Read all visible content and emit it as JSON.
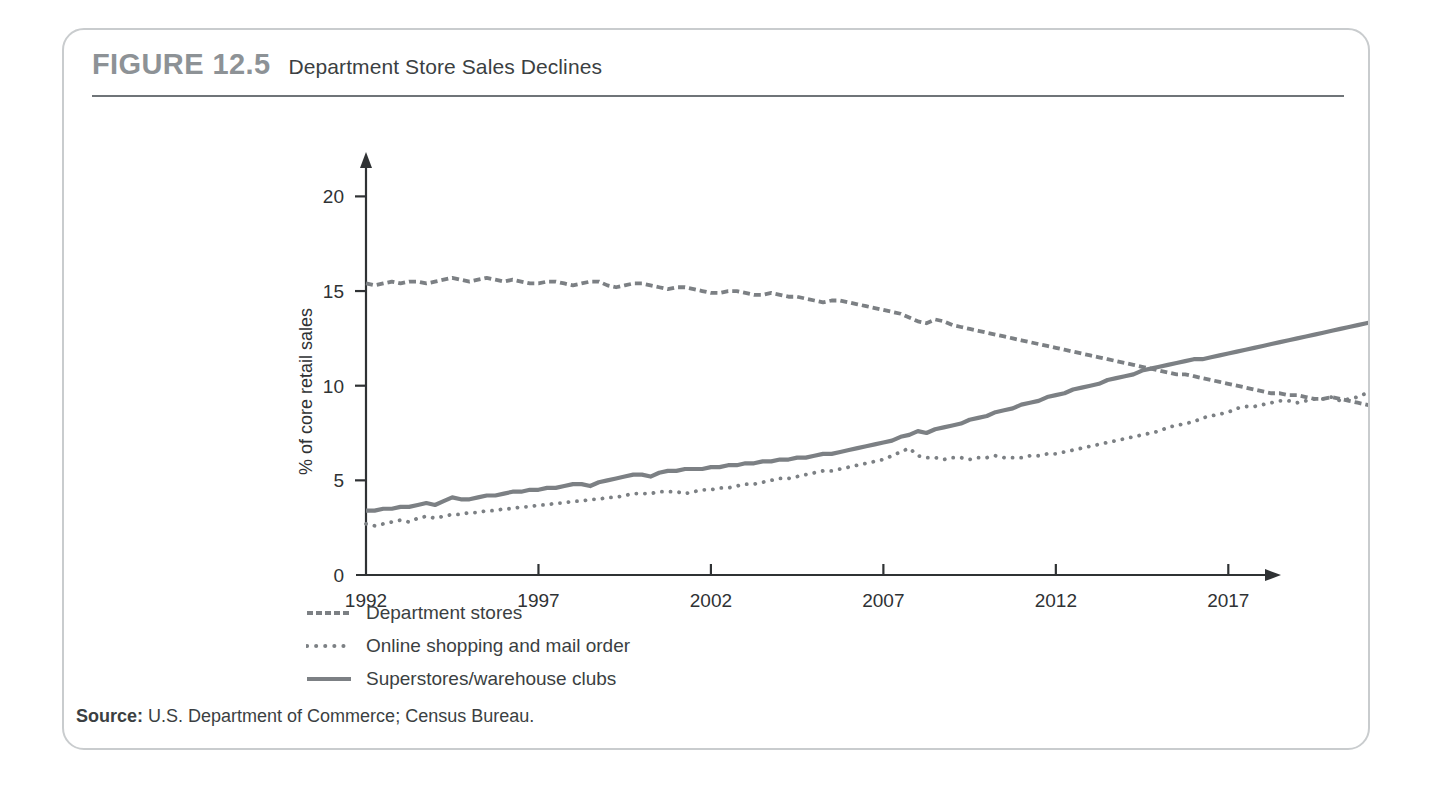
{
  "figure": {
    "number": "FIGURE 12.5",
    "title": "Department Store Sales Declines",
    "source_prefix": "Source:",
    "source_text": "U.S. Department of Commerce; Census Bureau."
  },
  "colors": {
    "line": "#7c8084",
    "frame": "#c9ccce",
    "rule": "#6f7478",
    "figure_number": "#8d9296",
    "text": "#3b3f42",
    "axis": "#2f3234"
  },
  "legend": {
    "position": "below-plot",
    "items": [
      {
        "label": "Department stores",
        "style": "dashed",
        "icon": "dashed-line-icon"
      },
      {
        "label": "Online shopping and mail order",
        "style": "dotted",
        "icon": "dotted-line-icon"
      },
      {
        "label": "Superstores/warehouse clubs",
        "style": "solid",
        "icon": "solid-line-icon"
      }
    ]
  },
  "chart_data": {
    "type": "line",
    "title": "Department Store Sales Declines",
    "xlabel": "",
    "ylabel": "% of core retail sales",
    "xlim": [
      1992,
      2017.6
    ],
    "ylim": [
      0,
      21.5
    ],
    "xticks": [
      1992,
      1997,
      2002,
      2007,
      2012,
      2017
    ],
    "xtick_labels": [
      "1992",
      "1997",
      "2002",
      "2007",
      "2012",
      "2017"
    ],
    "yticks": [
      0,
      5,
      10,
      15,
      20
    ],
    "ytick_labels": [
      "0",
      "5",
      "10",
      "15",
      "20"
    ],
    "grid": false,
    "axis_arrows": true,
    "x_start": 1992,
    "x_step": 0.25,
    "series": [
      {
        "name": "Department stores",
        "style": "dashed",
        "values": [
          15.4,
          15.3,
          15.4,
          15.5,
          15.4,
          15.5,
          15.5,
          15.4,
          15.5,
          15.6,
          15.7,
          15.6,
          15.5,
          15.6,
          15.7,
          15.6,
          15.5,
          15.6,
          15.5,
          15.4,
          15.4,
          15.5,
          15.5,
          15.4,
          15.3,
          15.4,
          15.5,
          15.5,
          15.3,
          15.2,
          15.3,
          15.4,
          15.4,
          15.3,
          15.2,
          15.1,
          15.2,
          15.2,
          15.1,
          15.0,
          14.9,
          14.9,
          15.0,
          15.0,
          14.9,
          14.8,
          14.8,
          14.9,
          14.8,
          14.7,
          14.7,
          14.6,
          14.5,
          14.4,
          14.5,
          14.5,
          14.4,
          14.3,
          14.2,
          14.1,
          14.0,
          13.9,
          13.8,
          13.6,
          13.4,
          13.3,
          13.5,
          13.4,
          13.2,
          13.1,
          13.0,
          12.9,
          12.8,
          12.7,
          12.6,
          12.5,
          12.4,
          12.3,
          12.2,
          12.1,
          12.0,
          11.9,
          11.8,
          11.7,
          11.6,
          11.5,
          11.4,
          11.3,
          11.2,
          11.1,
          11.0,
          10.9,
          10.8,
          10.7,
          10.6,
          10.6,
          10.5,
          10.4,
          10.3,
          10.2,
          10.1,
          10.0,
          9.9,
          9.8,
          9.7,
          9.6,
          9.6,
          9.5,
          9.5,
          9.4,
          9.3,
          9.3,
          9.4,
          9.3,
          9.2,
          9.1,
          9.0,
          8.9,
          8.9,
          8.8,
          8.7,
          8.6,
          8.5,
          8.4,
          8.3,
          8.2,
          8.1,
          8.0,
          7.9,
          7.8,
          7.7,
          7.6,
          7.5,
          7.4,
          7.3,
          7.2,
          7.2,
          7.1,
          7.0,
          6.9,
          6.8,
          6.7,
          6.6,
          6.5,
          6.4,
          6.3,
          6.2,
          6.1,
          6.0,
          5.9,
          5.9,
          5.8,
          5.8,
          5.7,
          5.6,
          5.6,
          5.5,
          5.4,
          5.3,
          5.2,
          5.2,
          5.1,
          5.1,
          5.0,
          5.0,
          4.9,
          4.9,
          4.8,
          4.8,
          4.8,
          4.8
        ]
      },
      {
        "name": "Online shopping and mail order",
        "style": "dotted",
        "values": [
          2.7,
          2.6,
          2.7,
          2.8,
          2.9,
          2.8,
          3.0,
          3.1,
          3.0,
          3.1,
          3.2,
          3.2,
          3.3,
          3.3,
          3.4,
          3.4,
          3.5,
          3.5,
          3.6,
          3.6,
          3.7,
          3.7,
          3.8,
          3.8,
          3.9,
          3.9,
          4.0,
          4.0,
          4.1,
          4.1,
          4.2,
          4.3,
          4.3,
          4.3,
          4.4,
          4.4,
          4.4,
          4.3,
          4.4,
          4.5,
          4.5,
          4.6,
          4.6,
          4.7,
          4.8,
          4.8,
          4.9,
          5.0,
          5.1,
          5.1,
          5.2,
          5.3,
          5.4,
          5.5,
          5.5,
          5.6,
          5.7,
          5.8,
          5.9,
          6.0,
          6.1,
          6.3,
          6.5,
          6.7,
          6.3,
          6.2,
          6.2,
          6.1,
          6.2,
          6.2,
          6.1,
          6.2,
          6.2,
          6.3,
          6.2,
          6.2,
          6.2,
          6.3,
          6.3,
          6.4,
          6.4,
          6.5,
          6.6,
          6.7,
          6.8,
          6.9,
          7.0,
          7.1,
          7.2,
          7.3,
          7.4,
          7.5,
          7.6,
          7.8,
          7.9,
          8.0,
          8.1,
          8.3,
          8.4,
          8.5,
          8.6,
          8.8,
          8.9,
          8.9,
          9.0,
          9.1,
          9.2,
          9.2,
          9.1,
          9.2,
          9.3,
          9.3,
          9.4,
          9.2,
          9.3,
          9.4,
          9.6,
          9.7,
          9.8,
          10.0,
          10.1,
          10.3,
          10.5,
          10.6,
          10.8,
          10.9,
          11.1,
          11.2,
          11.3,
          11.4,
          11.5,
          11.6,
          11.6,
          11.7,
          11.8,
          11.9,
          12.0,
          12.1,
          12.1,
          12.2,
          12.3,
          12.4,
          12.6,
          12.8,
          13.0,
          13.1,
          13.1,
          12.9,
          13.2,
          13.4,
          13.6,
          13.8,
          14.0,
          14.2,
          14.4,
          14.6,
          14.8,
          15.0,
          15.2,
          15.3,
          15.5,
          15.7,
          15.9,
          16.1,
          16.3,
          16.5,
          16.7,
          16.9,
          17.0,
          17.1,
          17.2
        ]
      },
      {
        "name": "Superstores/warehouse clubs",
        "style": "solid",
        "values": [
          3.4,
          3.4,
          3.5,
          3.5,
          3.6,
          3.6,
          3.7,
          3.8,
          3.7,
          3.9,
          4.1,
          4.0,
          4.0,
          4.1,
          4.2,
          4.2,
          4.3,
          4.4,
          4.4,
          4.5,
          4.5,
          4.6,
          4.6,
          4.7,
          4.8,
          4.8,
          4.7,
          4.9,
          5.0,
          5.1,
          5.2,
          5.3,
          5.3,
          5.2,
          5.4,
          5.5,
          5.5,
          5.6,
          5.6,
          5.6,
          5.7,
          5.7,
          5.8,
          5.8,
          5.9,
          5.9,
          6.0,
          6.0,
          6.1,
          6.1,
          6.2,
          6.2,
          6.3,
          6.4,
          6.4,
          6.5,
          6.6,
          6.7,
          6.8,
          6.9,
          7.0,
          7.1,
          7.3,
          7.4,
          7.6,
          7.5,
          7.7,
          7.8,
          7.9,
          8.0,
          8.2,
          8.3,
          8.4,
          8.6,
          8.7,
          8.8,
          9.0,
          9.1,
          9.2,
          9.4,
          9.5,
          9.6,
          9.8,
          9.9,
          10.0,
          10.1,
          10.3,
          10.4,
          10.5,
          10.6,
          10.8,
          10.9,
          11.0,
          11.1,
          11.2,
          11.3,
          11.4,
          11.4,
          11.5,
          11.6,
          11.7,
          11.8,
          11.9,
          12.0,
          12.1,
          12.2,
          12.3,
          12.4,
          12.5,
          12.6,
          12.7,
          12.8,
          12.9,
          13.0,
          13.1,
          13.2,
          13.3,
          13.4,
          13.5,
          13.6,
          13.7,
          13.9,
          14.0,
          14.2,
          14.3,
          14.5,
          14.6,
          14.8,
          14.9,
          15.0,
          15.0,
          15.0,
          15.0,
          15.1,
          15.0,
          15.0,
          15.1,
          15.1,
          15.0,
          15.1,
          15.1,
          15.1,
          15.2,
          15.2,
          15.2,
          15.1,
          15.2,
          15.3,
          15.2,
          15.1,
          15.0,
          15.1,
          15.1,
          15.2,
          15.3,
          15.2,
          15.1,
          15.0,
          15.0,
          15.0,
          14.9,
          14.9,
          14.8,
          14.8,
          14.9,
          14.8,
          14.7,
          14.7,
          14.8,
          14.7,
          14.7
        ]
      }
    ]
  }
}
